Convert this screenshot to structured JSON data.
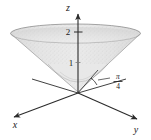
{
  "figure": {
    "type": "3d-surface-diagram",
    "background_color": "#ffffff",
    "width": 151,
    "height": 140
  },
  "axes": {
    "x": {
      "label": "x",
      "direction": "lower-left",
      "arrow": true
    },
    "y": {
      "label": "y",
      "direction": "lower-right",
      "arrow": true
    },
    "z": {
      "label": "z",
      "direction": "up",
      "arrow": true
    }
  },
  "ticks": {
    "z": [
      {
        "value": "1",
        "label": "1"
      },
      {
        "value": "2",
        "label": "2"
      }
    ]
  },
  "annotation": {
    "angle_numerator": "π",
    "angle_denominator": "4",
    "leader_line": true
  },
  "surface": {
    "name": "cone",
    "fill_color": "#dcdcdc",
    "edge_color": "#9a9a9a",
    "stipple": true,
    "top_radius_label": "",
    "apex_at_origin": true
  },
  "colors": {
    "line": "#2b2b2b",
    "dashed": "#9a9a9a",
    "surface_light": "#ececec",
    "surface_mid": "#d6d6d6",
    "surface_dark": "#c2c2c2"
  }
}
